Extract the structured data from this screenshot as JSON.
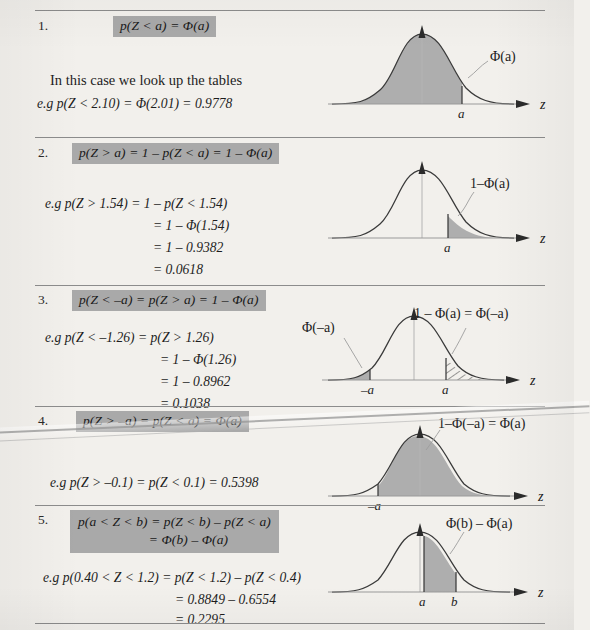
{
  "page": {
    "background": "#f2f0ec",
    "highlight_color": "#a9a9a9",
    "curve_fill_color": "#aeaeae",
    "axis_label": "z"
  },
  "sections": [
    {
      "number": "1.",
      "rule_formula": "p(Z < a)  =  Φ(a)",
      "lines": [
        "In this case we look up the tables",
        "e.g p(Z < 2.10)  =  Φ(2.01)  =  0.9778"
      ],
      "diagram": {
        "type": "normal-curve",
        "shading": "left-tail-to-a",
        "annotation": "Φ(a)",
        "x_ticks": [
          "a"
        ]
      }
    },
    {
      "number": "2.",
      "rule_formula": "p(Z > a)  =  1 – p(Z < a)  =  1 – Φ(a)",
      "lines": [
        "e.g p(Z > 1.54)  =  1 – p(Z < 1.54)",
        "=  1 – Φ(1.54)",
        "=  1 – 0.9382",
        "=  0.0618"
      ],
      "diagram": {
        "type": "normal-curve",
        "shading": "right-tail-from-a",
        "annotation": "1–Φ(a)",
        "x_ticks": [
          "a"
        ]
      }
    },
    {
      "number": "3.",
      "rule_formula": "p(Z < –a)  =  p(Z > a)  =  1 – Φ(a)",
      "lines": [
        "e.g p(Z < –1.26)  =  p(Z > 1.26)",
        "=  1 – Φ(1.26)",
        "=  1 – 0.8962",
        "=  0.1038"
      ],
      "diagram": {
        "type": "normal-curve",
        "shading": "both-tails",
        "annotation_left": "Φ(–a)",
        "annotation_right": "1 – Φ(a)  =  Φ(–a)",
        "x_ticks": [
          "–a",
          "a"
        ]
      }
    },
    {
      "number": "4.",
      "rule_formula": "p(Z > –a)  =  p(Z < a)  =  Φ(a)",
      "lines": [
        "e.g p(Z > –0.1)  =  p(Z < 0.1)  =  0.5398"
      ],
      "diagram": {
        "type": "normal-curve",
        "shading": "right-of-minus-a",
        "annotation": "1–Φ(–a)  =  Φ(a)",
        "x_ticks": [
          "–a"
        ]
      }
    },
    {
      "number": "5.",
      "rule_formula_line1": "p(a < Z < b)  =  p(Z < b) – p(Z < a)",
      "rule_formula_line2": "=  Φ(b) – Φ(a)",
      "lines": [
        "e.g p(0.40 < Z < 1.2)  =  p(Z < 1.2) – p(Z < 0.4)",
        "=  0.8849 – 0.6554",
        "=  0.2295"
      ],
      "diagram": {
        "type": "normal-curve",
        "shading": "between-a-and-b",
        "annotation": "Φ(b) – Φ(a)",
        "x_ticks": [
          "a",
          "b"
        ]
      }
    }
  ]
}
